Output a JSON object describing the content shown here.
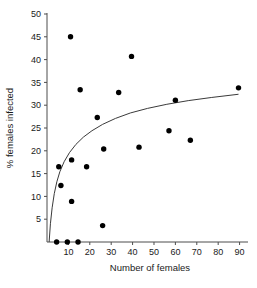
{
  "chart_data": {
    "type": "scatter",
    "title": "",
    "xlabel": "Number of females",
    "ylabel": "% females infected",
    "xlim": [
      0,
      93
    ],
    "ylim": [
      0,
      50
    ],
    "xticks": [
      10,
      20,
      30,
      40,
      50,
      60,
      70,
      80,
      90
    ],
    "yticks": [
      5,
      10,
      15,
      20,
      25,
      30,
      35,
      40,
      45,
      50
    ],
    "grid": false,
    "legend": null,
    "point_color": "#000000",
    "curve_color": "#3a3a3a",
    "axis_color": "#4d4d4d",
    "points": [
      {
        "x": 4.5,
        "y": 0.0
      },
      {
        "x": 9.5,
        "y": 0.0
      },
      {
        "x": 14.5,
        "y": 0.0
      },
      {
        "x": 11.0,
        "y": 45.0
      },
      {
        "x": 39.5,
        "y": 40.7
      },
      {
        "x": 15.5,
        "y": 33.4
      },
      {
        "x": 33.5,
        "y": 32.8
      },
      {
        "x": 89.5,
        "y": 33.8
      },
      {
        "x": 60.0,
        "y": 31.1
      },
      {
        "x": 23.5,
        "y": 27.3
      },
      {
        "x": 57.0,
        "y": 24.4
      },
      {
        "x": 67.0,
        "y": 22.3
      },
      {
        "x": 43.0,
        "y": 20.8
      },
      {
        "x": 26.5,
        "y": 20.4
      },
      {
        "x": 11.5,
        "y": 18.0
      },
      {
        "x": 5.5,
        "y": 16.5
      },
      {
        "x": 18.5,
        "y": 16.5
      },
      {
        "x": 6.5,
        "y": 12.4
      },
      {
        "x": 11.5,
        "y": 8.9
      },
      {
        "x": 26.0,
        "y": 3.6
      }
    ],
    "curve": {
      "description": "logarithmic fit rising steeply from origin then flattening",
      "points": [
        {
          "x": 1.0,
          "y": 0.0
        },
        {
          "x": 1.6,
          "y": 4.0
        },
        {
          "x": 2.4,
          "y": 7.5
        },
        {
          "x": 3.4,
          "y": 10.6
        },
        {
          "x": 4.6,
          "y": 13.2
        },
        {
          "x": 6.0,
          "y": 15.4
        },
        {
          "x": 8.0,
          "y": 17.6
        },
        {
          "x": 10.5,
          "y": 19.6
        },
        {
          "x": 13.5,
          "y": 21.4
        },
        {
          "x": 17.0,
          "y": 23.0
        },
        {
          "x": 21.0,
          "y": 24.4
        },
        {
          "x": 26.0,
          "y": 25.8
        },
        {
          "x": 32.0,
          "y": 27.1
        },
        {
          "x": 39.0,
          "y": 28.3
        },
        {
          "x": 47.0,
          "y": 29.3
        },
        {
          "x": 56.0,
          "y": 30.2
        },
        {
          "x": 66.0,
          "y": 31.0
        },
        {
          "x": 77.0,
          "y": 31.7
        },
        {
          "x": 89.5,
          "y": 32.4
        }
      ]
    }
  }
}
